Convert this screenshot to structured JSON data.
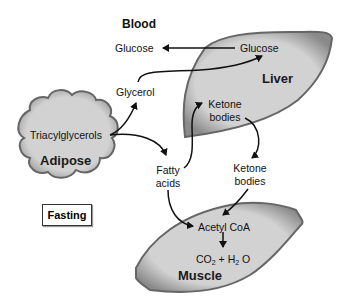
{
  "diagram": {
    "title": "Blood",
    "context_label": "Fasting",
    "colors": {
      "organ_fill": "#cfcfcf",
      "organ_edge": "#555555",
      "arrow": "#111111",
      "text": "#111111"
    },
    "organs": {
      "liver": {
        "label": "Liver",
        "nodes": [
          "Glucose",
          "Ketone bodies"
        ]
      },
      "adipose": {
        "label": "Adipose",
        "nodes": [
          "Triacylglycerols"
        ]
      },
      "muscle": {
        "label": "Muscle",
        "nodes": [
          "Acetyl CoA",
          "CO2 + H2O"
        ]
      }
    },
    "nodes": {
      "blood_glucose": "Glucose",
      "liver_glucose": "Glucose",
      "glycerol": "Glycerol",
      "triacylglycerols": "Triacylglycerols",
      "liver_ketone_1": "Ketone",
      "liver_ketone_2": "bodies",
      "fatty_1": "Fatty",
      "fatty_2": "acids",
      "blood_ketone_1": "Ketone",
      "blood_ketone_2": "bodies",
      "acetyl_coa": "Acetyl CoA",
      "co2": "CO",
      "co2_sub": "2",
      "plus_h": "+ H",
      "h2o_sub": "2",
      "o": "O"
    },
    "edges": [
      {
        "from": "Glucose (liver)",
        "to": "Glucose (blood)"
      },
      {
        "from": "Glycerol",
        "to": "Glucose (liver)"
      },
      {
        "from": "Triacylglycerols",
        "to": "Glycerol"
      },
      {
        "from": "Triacylglycerols",
        "to": "Fatty acids"
      },
      {
        "from": "Fatty acids",
        "to": "Ketone bodies (liver)"
      },
      {
        "from": "Ketone bodies (liver)",
        "to": "Ketone bodies (blood)"
      },
      {
        "from": "Ketone bodies (blood)",
        "to": "Acetyl CoA"
      },
      {
        "from": "Fatty acids",
        "to": "Acetyl CoA"
      },
      {
        "from": "Acetyl CoA",
        "to": "CO2 + H2O"
      }
    ]
  }
}
